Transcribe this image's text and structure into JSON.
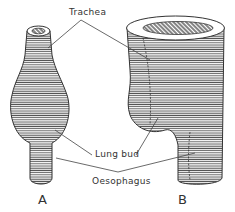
{
  "labels": {
    "trachea": "Trachea",
    "lung_bud": "Lung bud",
    "oesophagus": "Oesophagus"
  },
  "figures": {
    "a": "A",
    "b": "B"
  },
  "colors": {
    "ink": "#333333",
    "hatch": "#444444",
    "background": "#ffffff"
  }
}
